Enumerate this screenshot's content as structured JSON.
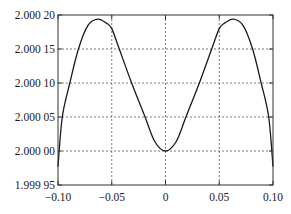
{
  "chart_data": {
    "type": "line",
    "title": "",
    "xlabel": "",
    "ylabel": "",
    "xlim": [
      -0.1,
      0.1
    ],
    "ylim": [
      1.99995,
      2.0002
    ],
    "grid": true,
    "legend": null,
    "x_ticks": [
      -0.1,
      -0.05,
      0,
      0.05,
      0.1
    ],
    "x_tick_labels": [
      "−0.10",
      "−0.05",
      "0",
      "0.05",
      "0.10"
    ],
    "y_ticks": [
      1.99995,
      2.0,
      2.00005,
      2.0001,
      2.00015,
      2.0002
    ],
    "y_tick_labels": [
      "1.999 95",
      "2.000 00",
      "2.000 05",
      "2.000 10",
      "2.000 15",
      "2.000 20"
    ],
    "series": [
      {
        "name": "f(x)",
        "color": "#1a1a1a",
        "x": [
          -0.1,
          -0.096,
          -0.089,
          -0.081,
          -0.072,
          -0.063,
          -0.055,
          -0.05,
          -0.043,
          -0.0315,
          -0.019,
          -0.01,
          0.0,
          0.01,
          0.019,
          0.0315,
          0.043,
          0.05,
          0.055,
          0.063,
          0.072,
          0.081,
          0.089,
          0.096,
          0.1
        ],
        "y": [
          1.999977,
          2.00005,
          2.0001,
          2.00015,
          2.000185,
          2.000194,
          2.000188,
          2.00018,
          2.00015,
          2.0001,
          2.00005,
          2.000014,
          2.0,
          2.000014,
          2.00005,
          2.0001,
          2.00015,
          2.00018,
          2.000188,
          2.000194,
          2.000185,
          2.00015,
          2.0001,
          2.00005,
          1.999977
        ]
      }
    ]
  },
  "plot_area": {
    "left": 58,
    "top": 15,
    "right": 273,
    "bottom": 185
  },
  "colors": {
    "frame": "#333333",
    "grid": "#555555",
    "line": "#1a1a1a",
    "background": "#ffffff"
  }
}
